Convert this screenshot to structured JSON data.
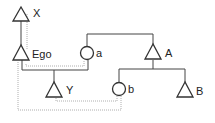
{
  "diagram": {
    "type": "kinship-chart",
    "nodes": [
      {
        "id": "X",
        "label": "X",
        "shape": "triangle",
        "sex": "male"
      },
      {
        "id": "Ego",
        "label": "Ego",
        "shape": "triangle",
        "sex": "male"
      },
      {
        "id": "a",
        "label": "a",
        "shape": "circle",
        "sex": "female"
      },
      {
        "id": "A",
        "label": "A",
        "shape": "triangle",
        "sex": "male"
      },
      {
        "id": "Y",
        "label": "Y",
        "shape": "triangle",
        "sex": "male"
      },
      {
        "id": "b",
        "label": "b",
        "shape": "circle",
        "sex": "female"
      },
      {
        "id": "B",
        "label": "B",
        "shape": "triangle",
        "sex": "male"
      }
    ],
    "edges": [
      {
        "from": "X",
        "to": "Ego",
        "kind": "descent"
      },
      {
        "from": "Ego",
        "to": "a",
        "kind": "marriage"
      },
      {
        "from": "Ego+a",
        "to": "Y",
        "kind": "descent"
      },
      {
        "from": "A",
        "to": "a",
        "kind": "sibling"
      },
      {
        "from": "A",
        "to": "b",
        "kind": "descent"
      },
      {
        "from": "A",
        "to": "B",
        "kind": "descent"
      },
      {
        "from": "Y",
        "to": "b",
        "kind": "dotted-link"
      },
      {
        "from": "Ego",
        "to": "b",
        "kind": "dotted-link"
      },
      {
        "from": "X",
        "to": "a",
        "kind": "dotted-link"
      }
    ]
  }
}
